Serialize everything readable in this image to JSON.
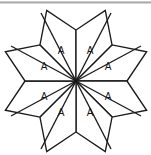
{
  "figure": {
    "background_color": "#ffffff",
    "line_color": "#1a1a1a",
    "top_rule_color": "#9a9a9a",
    "center": {
      "x": 76,
      "y": 81
    },
    "pieces": [
      {
        "id": "piece-n-left",
        "label": "A",
        "label_x": 61,
        "label_y": 51,
        "tip_x": 41,
        "tip_y": 13,
        "points": "76,81 41,13 76,22 111,13"
      },
      {
        "id": "piece-n-right",
        "label": "A",
        "label_x": 90,
        "label_y": 51,
        "tip_x": 111,
        "tip_y": 13
      },
      {
        "id": "piece-w-upper",
        "label": "A",
        "label_x": 44,
        "label_y": 67,
        "tip_x": 11,
        "tip_y": 46
      },
      {
        "id": "piece-e-upper",
        "label": "A",
        "label_x": 108,
        "label_y": 67,
        "tip_x": 141,
        "tip_y": 46
      },
      {
        "id": "piece-w-lower",
        "label": "A",
        "label_x": 44,
        "label_y": 97,
        "tip_x": 11,
        "tip_y": 116
      },
      {
        "id": "piece-e-lower",
        "label": "A",
        "label_x": 108,
        "label_y": 97,
        "tip_x": 141,
        "tip_y": 116
      },
      {
        "id": "piece-s-left",
        "label": "A",
        "label_x": 61,
        "label_y": 113,
        "tip_x": 41,
        "tip_y": 149
      },
      {
        "id": "piece-s-right",
        "label": "A",
        "label_x": 90,
        "label_y": 113,
        "tip_x": 111,
        "tip_y": 149
      }
    ],
    "geometry": {
      "outer_tips": [
        {
          "name": "tip-north-left",
          "x": 41,
          "y": 13
        },
        {
          "name": "tip-north-right",
          "x": 111,
          "y": 13
        },
        {
          "name": "tip-west-upper",
          "x": 11,
          "y": 46
        },
        {
          "name": "tip-east-upper",
          "x": 141,
          "y": 46
        },
        {
          "name": "tip-west-lower",
          "x": 11,
          "y": 116
        },
        {
          "name": "tip-east-lower",
          "x": 141,
          "y": 116
        },
        {
          "name": "tip-south-left",
          "x": 41,
          "y": 149
        },
        {
          "name": "tip-south-right",
          "x": 111,
          "y": 149
        }
      ],
      "inner_notches": [
        {
          "name": "notch-north",
          "x": 76,
          "y": 30
        },
        {
          "name": "notch-east",
          "x": 127,
          "y": 81
        },
        {
          "name": "notch-south",
          "x": 76,
          "y": 132
        },
        {
          "name": "notch-west",
          "x": 25,
          "y": 81
        }
      ]
    }
  }
}
